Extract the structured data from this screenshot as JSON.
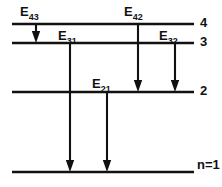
{
  "figure": {
    "background_color": "#ffffff",
    "ink_color": "#111111"
  },
  "levels": [
    {
      "id": "level-4",
      "label": "4",
      "n": 4,
      "y": 24,
      "x_start": 12,
      "x_end": 194,
      "label_x": 200,
      "label_y": 24
    },
    {
      "id": "level-3",
      "label": "3",
      "n": 3,
      "y": 43,
      "x_start": 12,
      "x_end": 194,
      "label_x": 200,
      "label_y": 43
    },
    {
      "id": "level-2",
      "label": "2",
      "n": 2,
      "y": 92,
      "x_start": 12,
      "x_end": 194,
      "label_x": 200,
      "label_y": 92
    },
    {
      "id": "level-1",
      "label": "n=1",
      "n": 1,
      "y": 172,
      "x_start": 12,
      "x_end": 194,
      "label_x": 197,
      "label_y": 166
    }
  ],
  "transitions": [
    {
      "id": "transition-E43",
      "label_base": "E",
      "label_sub": "43",
      "from_level": 4,
      "to_level": 3,
      "x": 36,
      "y_start": 24,
      "y_end": 43,
      "label_x": 20,
      "label_y": 16
    },
    {
      "id": "transition-E31",
      "label_base": "E",
      "label_sub": "31",
      "from_level": 3,
      "to_level": 1,
      "x": 70,
      "y_start": 43,
      "y_end": 172,
      "label_x": 58,
      "label_y": 40
    },
    {
      "id": "transition-E21",
      "label_base": "E",
      "label_sub": "21",
      "from_level": 2,
      "to_level": 1,
      "x": 107,
      "y_start": 92,
      "y_end": 172,
      "label_x": 92,
      "label_y": 88
    },
    {
      "id": "transition-E42",
      "label_base": "E",
      "label_sub": "42",
      "from_level": 4,
      "to_level": 2,
      "x": 138,
      "y_start": 24,
      "y_end": 92,
      "label_x": 124,
      "label_y": 16
    },
    {
      "id": "transition-E32",
      "label_base": "E",
      "label_sub": "32",
      "from_level": 3,
      "to_level": 2,
      "x": 175,
      "y_start": 43,
      "y_end": 92,
      "label_x": 159,
      "label_y": 40
    }
  ]
}
